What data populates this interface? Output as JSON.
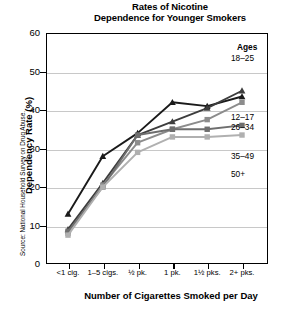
{
  "title": "Rates of Nicotine\nDependence for Younger Smokers",
  "title_line1": "Rates of Nicotine",
  "title_line2": "Dependence for Younger Smokers",
  "axes": {
    "x_title": "Number of Cigarettes Smoked per Day",
    "y_title": "Dependency Rate (%)",
    "y_ticks": [
      "0",
      "10",
      "20",
      "30",
      "40",
      "50",
      "60"
    ],
    "x_ticks": [
      "<1 cig.",
      "1–5 cigs.",
      "½ pk.",
      "1 pk.",
      "1½ pks.",
      "2+ pks."
    ]
  },
  "source": "Source: National Household Survey on Drug Abuse.",
  "legend": {
    "heading": "Ages",
    "label_18_25": "18–25",
    "label_12_17": "12–17",
    "label_26_34": "26–34",
    "label_35_49": "35–49",
    "label_50_plus": "50+"
  },
  "chart_data": {
    "type": "line",
    "title": "Rates of Nicotine Dependence for Younger Smokers",
    "xlabel": "Number of Cigarettes Smoked per Day",
    "ylabel": "Dependency Rate (%)",
    "categories": [
      "<1 cig.",
      "1–5 cigs.",
      "½ pk.",
      "1 pk.",
      "1½ pks.",
      "2+ pks."
    ],
    "ylim": [
      0,
      60
    ],
    "ytick_step": 10,
    "grid": "horizontal",
    "legend_position": "right-inline",
    "series": [
      {
        "name": "12–17",
        "color": "#1a1a1a",
        "marker": "triangle",
        "values": [
          13,
          28,
          34,
          42,
          41,
          43.5
        ]
      },
      {
        "name": "18–25",
        "color": "#3d3d3d",
        "marker": "triangle",
        "values": [
          9,
          21,
          33.5,
          37,
          40.5,
          45
        ]
      },
      {
        "name": "26–34",
        "color": "#8c8c8c",
        "marker": "square",
        "values": [
          8,
          20.5,
          31.5,
          35,
          37.5,
          42
        ]
      },
      {
        "name": "35–49",
        "color": "#6e6e6e",
        "marker": "square",
        "values": [
          8.5,
          20,
          33.5,
          35,
          35,
          36
        ]
      },
      {
        "name": "50+",
        "color": "#b0b0b0",
        "marker": "square",
        "values": [
          7.5,
          20,
          29,
          33,
          33,
          33.5
        ]
      }
    ]
  }
}
